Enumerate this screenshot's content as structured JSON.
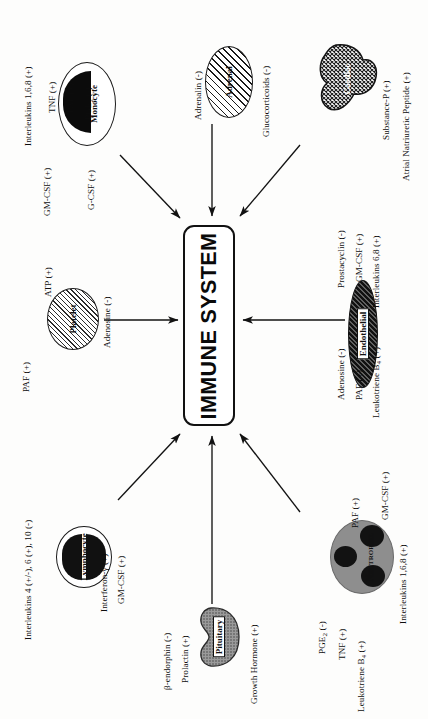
{
  "diagram": {
    "center": {
      "label": "IMMUNE SYSTEM"
    },
    "nodes": [
      {
        "id": "monocyte",
        "name": "Monocyte",
        "mediators": [
          "Interleukins 1,6,8 (+)",
          "TNF (+)",
          "PAF (+)",
          "PGE2 (-)",
          "GM-CSF (+)",
          "G-CSF (+)"
        ]
      },
      {
        "id": "adrenal",
        "name": "Adrenal",
        "mediators": [
          "Adrenalin (-)",
          "Glucocorticoids (-)"
        ]
      },
      {
        "id": "cardiac",
        "name": "Cardiac",
        "mediators": [
          "Substance-P (+)",
          "Atrial Natriuretic Peptide (+)"
        ]
      },
      {
        "id": "platelet",
        "name": "Platelet",
        "mediators": [
          "PAF (+)",
          "ATP (+)",
          "Adenosine (-)"
        ]
      },
      {
        "id": "endothelial",
        "name": "Endothelial",
        "mediators": [
          "Adenosine (-)",
          "Prostacyclin (-)",
          "PAF (+)",
          "GM-CSF (+)",
          "Leukotriene B4 (+)",
          "Interleukins 6,8 (+)"
        ]
      },
      {
        "id": "lymphocyte",
        "name": "Lymphocyte",
        "mediators": [
          "Interleukins 4 (+/-), 6 (+), 10 (-)",
          "Interferon-γ (+)",
          "GM-CSF (+)"
        ]
      },
      {
        "id": "pituitary",
        "name": "Pituitary",
        "mediators": [
          "β-endorphin (-)",
          "Prolactin (+)",
          "Growth Hormone (+)"
        ]
      },
      {
        "id": "neutrophil",
        "name": "Neutrophil",
        "mediators": [
          "PGE2 (-)",
          "TNF (+)",
          "PAF (+)",
          "GM-CSF (+)",
          "Leukotriene B4 (+)",
          "Interleukins 1,6,8 (+)"
        ]
      }
    ],
    "labels": {
      "monocyte_il": "Interleukins 1,6,8 (+)",
      "monocyte_tnf": "TNF (+)",
      "monocyte_paf": "PAF (+)",
      "monocyte_pge2_pre": "PGE",
      "monocyte_pge2_sub": "2",
      "monocyte_pge2_post": " (-)",
      "monocyte_gmcsf": "GM-CSF (+)",
      "monocyte_gcsf": "G-CSF (+)",
      "adrenal_adrenalin": "Adrenalin (-)",
      "adrenal_gluco": "Glucocorticoids (-)",
      "cardiac_substp": "Substance-P (+)",
      "cardiac_anp": "Atrial Natriuretic Peptide (+)",
      "platelet_paf": "PAF (+)",
      "platelet_atp": "ATP (+)",
      "platelet_adeno": "Adenosine (-)",
      "endo_adeno": "Adenosine (-)",
      "endo_prosta": "Prostacyclin (-)",
      "endo_paf": "PAF (+)",
      "endo_gmcsf": "GM-CSF (+)",
      "endo_ltb4_pre": "Leukotriene B",
      "endo_ltb4_sub": "4",
      "endo_ltb4_post": " (+)",
      "endo_il": "Interleukins 6,8 (+)",
      "lymph_il": "Interleukins 4 (+/-), 6 (+), 10 (-)",
      "lymph_ifn": "Interferon-γ (+)",
      "lymph_gmcsf": "GM-CSF (+)",
      "pit_bendo": "β-endorphin (-)",
      "pit_prolactin": "Prolactin (+)",
      "pit_gh": "Growth Hormone (+)",
      "neut_pge2_pre": "PGE",
      "neut_pge2_sub": "2",
      "neut_pge2_post": " (-)",
      "neut_tnf": "TNF (+)",
      "neut_paf": "PAF (+)",
      "neut_gmcsf": "GM-CSF (+)",
      "neut_ltb4_pre": "Leukotriene B",
      "neut_ltb4_sub": "4",
      "neut_ltb4_post": " (+)",
      "neut_il": "Interleukins 1,6,8 (+)",
      "name_monocyte": "Monocyte",
      "name_adrenal": "Adrenal",
      "name_cardiac": "Cardiac",
      "name_platelet": "Platelet",
      "name_endothelial": "Endothelial",
      "name_lymphocyte": "Lymphocyte",
      "name_pituitary": "Pituitary",
      "name_neutrophil": "Neutrophil"
    }
  }
}
